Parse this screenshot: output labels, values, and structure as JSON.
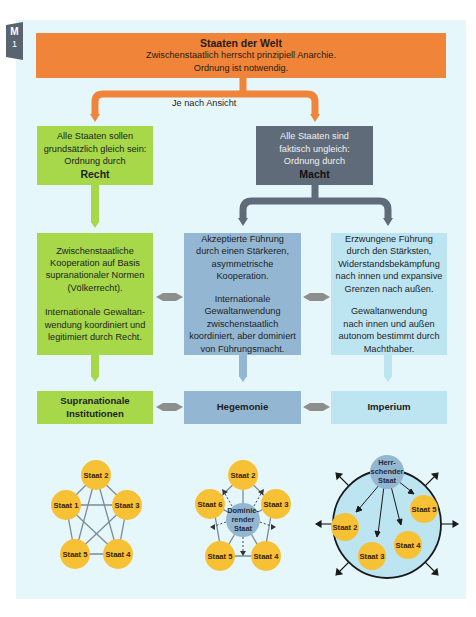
{
  "badge": {
    "letter": "M",
    "number": "1"
  },
  "top": {
    "title": "Staaten der Welt",
    "line1": "Zwischenstaatlich herrscht prinzipiell Anarchie.",
    "line2": "Ordnung ist notwendig."
  },
  "branch_label": "Je nach Ansicht",
  "left_view": {
    "line1": "Alle Staaten sollen",
    "line2": "grundsätzlich gleich sein:",
    "line3": "Ordnung durch",
    "key": "Recht"
  },
  "right_view": {
    "line1": "Alle Staaten sind",
    "line2": "faktisch ungleich:",
    "line3": "Ordnung durch",
    "key": "Macht"
  },
  "columns": [
    {
      "p1": [
        "Zwischenstaatliche",
        "Kooperation auf Basis",
        "supranationaler Normen",
        "(Völkerrecht)."
      ],
      "p2": [
        "Internationale Gewaltan-",
        "wendung koordiniert und",
        "legitimiert durch Recht."
      ],
      "result": [
        "Supranationale",
        "Institutionen"
      ]
    },
    {
      "p1": [
        "Akzeptierte Führung",
        "durch einen Stärkeren,",
        "asymmetrische",
        "Kooperation."
      ],
      "p2": [
        "Internationale",
        "Gewaltanwendung",
        "zwischenstaatlich",
        "koordiniert, aber dominiert",
        "von Führungsmacht."
      ],
      "result": [
        "Hegemonie"
      ]
    },
    {
      "p1": [
        "Erzwungene Führung",
        "durch den Stärksten,",
        "Widerstandsbekämpfung",
        "nach innen und expansive",
        "Grenzen nach außen."
      ],
      "p2": [
        "Gewaltanwendung",
        "nach innen und außen",
        "autonom bestimmt durch",
        "Machthaber."
      ],
      "result": [
        "Imperium"
      ]
    }
  ],
  "networks": {
    "equal": {
      "nodes": [
        "Staat 1",
        "Staat 2",
        "Staat 3",
        "Staat 4",
        "Staat 5"
      ]
    },
    "hegemony": {
      "center": [
        "Dominie-",
        "render",
        "Staat"
      ],
      "nodes": [
        "Staat 2",
        "Staat 3",
        "Staat 4",
        "Staat 5",
        "Staat 6"
      ]
    },
    "empire": {
      "center": [
        "Herr-",
        "schender",
        "Staat"
      ],
      "nodes": [
        "Staat 2",
        "Staat 3",
        "Staat 4",
        "Staat 5"
      ]
    }
  },
  "colors": {
    "panel": "#e6f7fb",
    "orange": "#f0853a",
    "green": "#a6d84a",
    "dark": "#5f6b79",
    "mid_blue": "#93b6d3",
    "light_blue": "#bde4f1",
    "node": "#f7c136",
    "connector": "#8e8e8e"
  }
}
